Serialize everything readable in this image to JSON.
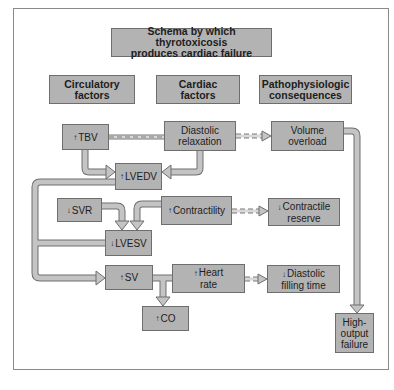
{
  "title": {
    "line1": "Schema by which thyrotoxicosis",
    "line2": "produces cardiac failure"
  },
  "headers": [
    {
      "line1": "Circulatory",
      "line2": "factors"
    },
    {
      "line1": "Cardiac",
      "line2": "factors"
    },
    {
      "line1": "Pathophysiologic",
      "line2": "consequences"
    }
  ],
  "arrows": {
    "up": "↑",
    "down": "↓"
  },
  "nodes": {
    "tbv": {
      "dir": "↑",
      "label": "TBV"
    },
    "diastolic_relaxation": {
      "line1": "Diastolic",
      "line2": "relaxation"
    },
    "volume_overload": {
      "line1": "Volume",
      "line2": "overload"
    },
    "lvedv": {
      "dir": "↑",
      "label": "LVEDV"
    },
    "svr": {
      "dir": "↓",
      "label": "SVR"
    },
    "contractility": {
      "dir": "↑",
      "label": "Contractility"
    },
    "contractile_reserve": {
      "dir": "↓",
      "line1": "Contractile",
      "line2": "reserve"
    },
    "lvesv": {
      "dir": "↓",
      "label": "LVESV"
    },
    "sv": {
      "dir": "↑",
      "label": "SV"
    },
    "heart_rate": {
      "dir": "↑",
      "line1": "Heart",
      "line2": "rate"
    },
    "diastolic_filling_time": {
      "dir": "↓",
      "line1": "Diastolic",
      "line2": "filling time"
    },
    "co": {
      "dir": "↑",
      "label": "CO"
    },
    "high_output_failure": {
      "line1": "High-",
      "line2": "output",
      "line3": "failure"
    }
  },
  "edges": [
    {
      "from": "TBV",
      "to": "Diastolic relaxation",
      "style": "dashed-connector"
    },
    {
      "from": "Diastolic relaxation",
      "to": "Volume overload",
      "style": "dashed-arrow"
    },
    {
      "from": "TBV",
      "to": "LVEDV",
      "style": "solid-arrow"
    },
    {
      "from": "Diastolic relaxation",
      "to": "LVEDV",
      "style": "solid-arrow"
    },
    {
      "from": "LVEDV",
      "to": "SV",
      "style": "solid-arrow"
    },
    {
      "from": "SVR",
      "to": "LVESV",
      "style": "solid-arrow"
    },
    {
      "from": "Contractility",
      "to": "LVESV",
      "style": "solid-arrow"
    },
    {
      "from": "Contractility",
      "to": "Contractile reserve",
      "style": "dashed-arrow"
    },
    {
      "from": "LVESV",
      "to": "SV",
      "style": "solid-arrow"
    },
    {
      "from": "SV",
      "to": "CO",
      "style": "solid-arrow"
    },
    {
      "from": "Heart rate",
      "to": "CO",
      "style": "solid-arrow"
    },
    {
      "from": "Heart rate",
      "to": "Diastolic filling time",
      "style": "dashed-arrow"
    },
    {
      "from": "Volume overload",
      "to": "High-output failure",
      "style": "solid-arrow"
    }
  ],
  "colors": {
    "box_fill": "#b3b3b3",
    "box_border": "#6e6e6e",
    "arrow_fill": "#c4c4c4",
    "arrow_stroke": "#6e6e6e",
    "frame": "#8a8a8a"
  }
}
